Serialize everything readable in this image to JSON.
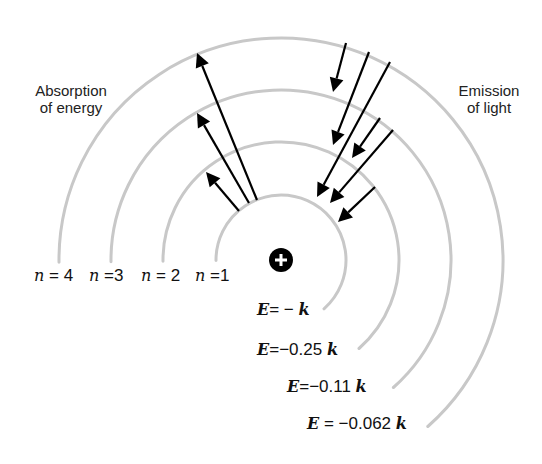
{
  "labels": {
    "absorption": [
      "Absorption",
      "of energy"
    ],
    "emission": [
      "Emission",
      "of light"
    ]
  },
  "nucleus": {
    "symbol": "+",
    "cx": 281,
    "cy": 260,
    "r": 12,
    "color": "#000000"
  },
  "orbits": [
    {
      "n": 1,
      "n_label": "n =1",
      "n_num": "1",
      "radius": 65,
      "energy_prefix": "E",
      "energy_value": "= − ",
      "energy_unit": "k",
      "energy_text": "E = −k"
    },
    {
      "n": 2,
      "n_label": "n = 2",
      "n_num": "2",
      "radius": 118,
      "energy_prefix": "E",
      "energy_value": "=−0.25 ",
      "energy_unit": "k",
      "energy_text": "E = −0.25k"
    },
    {
      "n": 3,
      "n_label": "n =3",
      "n_num": "3",
      "radius": 170,
      "energy_prefix": "E",
      "energy_value": "=−0.11 ",
      "energy_unit": "k",
      "energy_text": "E = −0.11k"
    },
    {
      "n": 4,
      "n_label": "n = 4",
      "n_num": "4",
      "radius": 222,
      "energy_prefix": "E",
      "energy_value": " =  −0.062 ",
      "energy_unit": "k",
      "energy_text": "E = −0.062k"
    }
  ],
  "absorption_arrows": [
    {
      "from_n": 1,
      "to_n": 4,
      "x1": 257,
      "y1": 200,
      "x2": 197,
      "y2": 53
    },
    {
      "from_n": 1,
      "to_n": 3,
      "x1": 249,
      "y1": 203,
      "x2": 197,
      "y2": 113
    },
    {
      "from_n": 1,
      "to_n": 2,
      "x1": 239,
      "y1": 211,
      "x2": 206,
      "y2": 172
    }
  ],
  "emission_arrows": [
    {
      "from_n": 4,
      "to_n": 3,
      "x1": 346,
      "y1": 43,
      "x2": 333,
      "y2": 92
    },
    {
      "from_n": 4,
      "to_n": 2,
      "x1": 369,
      "y1": 52,
      "x2": 333,
      "y2": 145
    },
    {
      "from_n": 4,
      "to_n": 1,
      "x1": 390,
      "y1": 62,
      "x2": 317,
      "y2": 197
    },
    {
      "from_n": 3,
      "to_n": 2,
      "x1": 380,
      "y1": 118,
      "x2": 352,
      "y2": 158
    },
    {
      "from_n": 3,
      "to_n": 1,
      "x1": 393,
      "y1": 130,
      "x2": 330,
      "y2": 203
    },
    {
      "from_n": 2,
      "to_n": 1,
      "x1": 375,
      "y1": 187,
      "x2": 338,
      "y2": 222
    }
  ],
  "colors": {
    "orbit": "#c8c8c8",
    "arrow": "#000000",
    "text": "#222222"
  }
}
